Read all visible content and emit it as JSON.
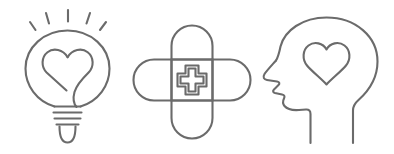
{
  "canvas": {
    "width": 394,
    "height": 154,
    "background_color": "#ffffff",
    "stroke_color": "#6b6b6b",
    "style": "line-art outline icons"
  },
  "icons": [
    {
      "id": "lightbulb-heart",
      "name": "Lightbulb with heart",
      "label": "Idea with heart",
      "parts": [
        "light-rays",
        "bulb-glass",
        "heart-filament",
        "bulb-base-ridges",
        "bulb-tip"
      ],
      "ray_count": 5
    },
    {
      "id": "crossed-bandages",
      "name": "Crossed bandages with medical cross",
      "label": "First aid",
      "parts": [
        "vertical-bandage",
        "horizontal-bandage",
        "medical-cross"
      ],
      "bandage_count": 2
    },
    {
      "id": "head-heart",
      "name": "Head profile with heart",
      "label": "Mental wellbeing",
      "parts": [
        "head-profile",
        "face-nose",
        "face-lips",
        "chin",
        "neck",
        "heart"
      ],
      "profile_direction": "left"
    }
  ]
}
